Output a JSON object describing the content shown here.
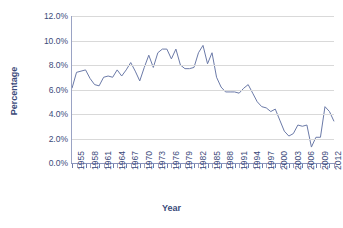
{
  "chart_data": {
    "type": "line",
    "title": "",
    "xlabel": "Year",
    "ylabel": "Percentage",
    "ylim": [
      0,
      12
    ],
    "ytick_labels": [
      "12.0%",
      "10.0%",
      "8.0%",
      "6.0%",
      "4.0%",
      "2.0%",
      "0.0%"
    ],
    "ytick_values": [
      12,
      10,
      8,
      6,
      4,
      2,
      0
    ],
    "grid": true,
    "legend": "none",
    "line_color": "#6b7aa8",
    "text_color": "#3b4a7a",
    "xlim": [
      1955,
      2013
    ],
    "xtick_labels": [
      "1955",
      "1958",
      "1961",
      "1964",
      "1967",
      "1970",
      "1973",
      "1976",
      "1979",
      "1982",
      "1985",
      "1988",
      "1991",
      "1994",
      "1997",
      "2000",
      "2003",
      "2006",
      "2009",
      "2012"
    ],
    "xtick_values": [
      1955,
      1958,
      1961,
      1964,
      1967,
      1970,
      1973,
      1976,
      1979,
      1982,
      1985,
      1988,
      1991,
      1994,
      1997,
      2000,
      2003,
      2006,
      2009,
      2012
    ],
    "x": [
      1955,
      1956,
      1957,
      1958,
      1959,
      1960,
      1961,
      1962,
      1963,
      1964,
      1965,
      1966,
      1967,
      1968,
      1969,
      1970,
      1971,
      1972,
      1973,
      1974,
      1975,
      1976,
      1977,
      1978,
      1979,
      1980,
      1981,
      1982,
      1983,
      1984,
      1985,
      1986,
      1987,
      1988,
      1989,
      1990,
      1991,
      1992,
      1993,
      1994,
      1995,
      1996,
      1997,
      1998,
      1999,
      2000,
      2001,
      2002,
      2003,
      2004,
      2005,
      2006,
      2007,
      2008,
      2009,
      2010,
      2011,
      2012,
      2013
    ],
    "values": [
      6.1,
      7.4,
      7.5,
      7.6,
      6.9,
      6.4,
      6.3,
      7.0,
      7.1,
      7.0,
      7.6,
      7.1,
      7.6,
      8.2,
      7.5,
      6.7,
      7.8,
      8.8,
      7.8,
      9.0,
      9.3,
      9.3,
      8.5,
      9.3,
      8.0,
      7.7,
      7.7,
      7.8,
      9.0,
      9.6,
      8.1,
      9.0,
      7.0,
      6.2,
      5.8,
      5.8,
      5.8,
      5.7,
      6.1,
      6.4,
      5.7,
      5.0,
      4.6,
      4.5,
      4.2,
      4.4,
      3.5,
      2.6,
      2.2,
      2.4,
      3.1,
      3.0,
      3.1,
      1.3,
      2.1,
      2.1,
      4.6,
      4.2,
      3.4
    ],
    "series_name": "Percentage"
  }
}
